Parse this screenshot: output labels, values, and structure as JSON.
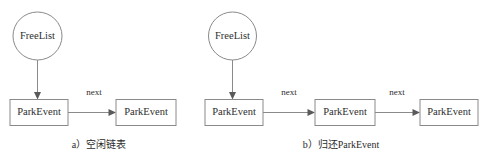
{
  "figure": {
    "background_color": "#ffffff",
    "stroke_color": "#8a8a8a",
    "text_color": "#2e2e2e",
    "panels": [
      {
        "id": "panel-a",
        "caption": "a）空闲链表",
        "root": {
          "label": "FreeList",
          "shape": "ellipse"
        },
        "nodes": [
          {
            "label": "ParkEvent",
            "shape": "rect"
          },
          {
            "label": "ParkEvent",
            "shape": "rect"
          }
        ],
        "edges": [
          {
            "from": "FreeList",
            "to": "ParkEvent",
            "label": "",
            "direction": "down"
          },
          {
            "from": "ParkEvent",
            "to": "ParkEvent",
            "label": "next",
            "direction": "right"
          }
        ]
      },
      {
        "id": "panel-b",
        "caption": "b）归还ParkEvent",
        "root": {
          "label": "FreeList",
          "shape": "ellipse"
        },
        "nodes": [
          {
            "label": "ParkEvent",
            "shape": "rect"
          },
          {
            "label": "ParkEvent",
            "shape": "rect"
          },
          {
            "label": "ParkEvent",
            "shape": "rect"
          }
        ],
        "edges": [
          {
            "from": "FreeList",
            "to": "ParkEvent",
            "label": "",
            "direction": "down"
          },
          {
            "from": "ParkEvent",
            "to": "ParkEvent",
            "label": "next",
            "direction": "right"
          },
          {
            "from": "ParkEvent",
            "to": "ParkEvent",
            "label": "next",
            "direction": "right"
          }
        ]
      }
    ]
  }
}
